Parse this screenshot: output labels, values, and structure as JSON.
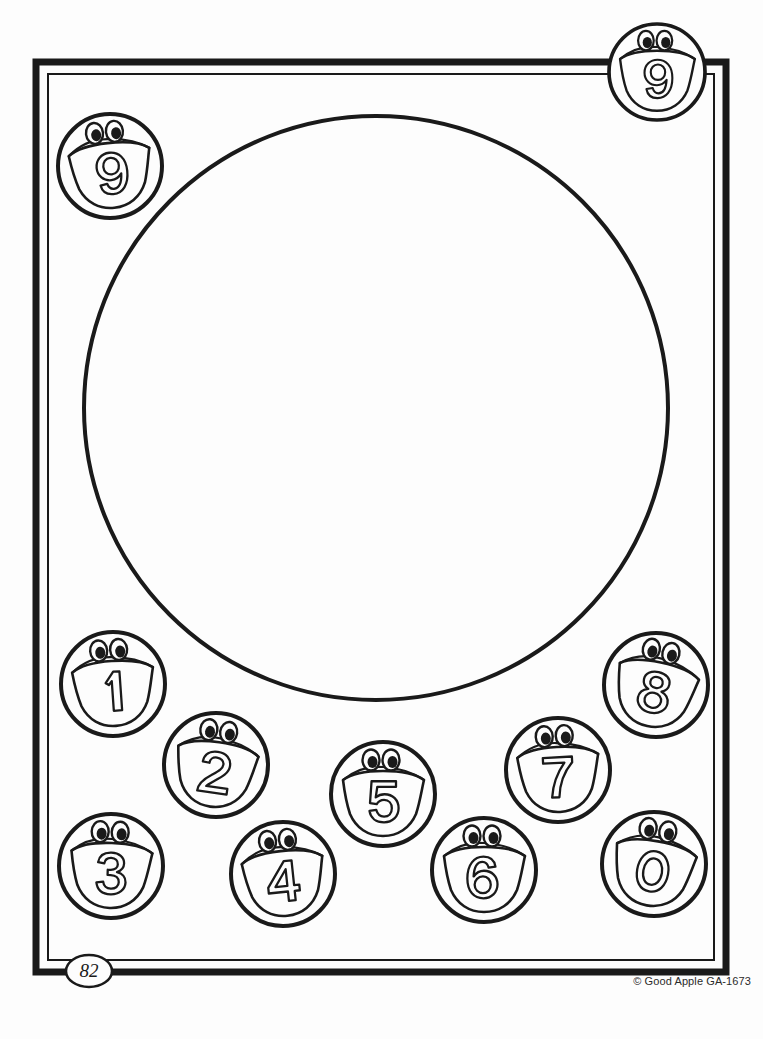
{
  "page": {
    "page_number": "82",
    "copyright": "© Good Apple GA-1673",
    "background_color": "#fdfdfd",
    "ink_color": "#1a1a1a"
  },
  "border": {
    "outer_stroke_width": 7,
    "inner_stroke_width": 2,
    "outer": {
      "x": 36,
      "y": 62,
      "width": 690,
      "height": 910
    },
    "inner": {
      "x": 48,
      "y": 74,
      "width": 666,
      "height": 886
    }
  },
  "main_circle": {
    "name": "large-empty-circle",
    "cx": 376,
    "cy": 408,
    "r": 292,
    "stroke_width": 4,
    "fill": "none"
  },
  "characters": [
    {
      "id": "nine-top-left",
      "digit": "9",
      "cx": 110,
      "cy": 166,
      "r": 52,
      "eye_angle": -6,
      "label": "number-character-9"
    },
    {
      "id": "nine-top-right",
      "digit": "9",
      "cx": 657,
      "cy": 72,
      "r": 48,
      "eye_angle": 0,
      "label": "number-character-9"
    },
    {
      "id": "one",
      "digit": "1",
      "cx": 113,
      "cy": 684,
      "r": 52,
      "eye_angle": -4,
      "label": "number-character-1"
    },
    {
      "id": "two",
      "digit": "2",
      "cx": 216,
      "cy": 765,
      "r": 52,
      "eye_angle": 8,
      "label": "number-character-2"
    },
    {
      "id": "three",
      "digit": "3",
      "cx": 111,
      "cy": 866,
      "r": 52,
      "eye_angle": 2,
      "label": "number-character-3"
    },
    {
      "id": "four",
      "digit": "4",
      "cx": 283,
      "cy": 874,
      "r": 52,
      "eye_angle": -6,
      "label": "number-character-4"
    },
    {
      "id": "five",
      "digit": "5",
      "cx": 383,
      "cy": 794,
      "r": 52,
      "eye_angle": 0,
      "label": "number-character-5"
    },
    {
      "id": "six",
      "digit": "6",
      "cx": 484,
      "cy": 870,
      "r": 52,
      "eye_angle": 0,
      "label": "number-character-6"
    },
    {
      "id": "seven",
      "digit": "7",
      "cx": 558,
      "cy": 770,
      "r": 52,
      "eye_angle": -3,
      "label": "number-character-7"
    },
    {
      "id": "eight",
      "digit": "8",
      "cx": 656,
      "cy": 685,
      "r": 52,
      "eye_angle": 12,
      "label": "number-character-8"
    },
    {
      "id": "zero",
      "digit": "0",
      "cx": 654,
      "cy": 864,
      "r": 52,
      "eye_angle": 10,
      "label": "number-character-0"
    }
  ],
  "digit_sequence": [
    "9",
    "9",
    "1",
    "2",
    "3",
    "4",
    "5",
    "6",
    "7",
    "8",
    "0"
  ]
}
